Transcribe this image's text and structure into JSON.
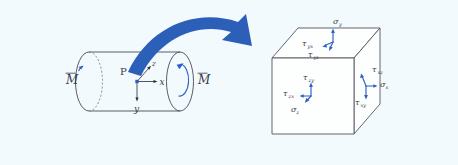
{
  "figure": {
    "background_color": "#f2fafd",
    "accent_color": "#2b5fb8",
    "outline_color": "#55555f",
    "label_color": "#3a3a48"
  },
  "cylinder": {
    "point_label": "P",
    "moment_left_label": "M",
    "moment_left_overbar": true,
    "moment_right_label": "M",
    "moment_right_overbar": true,
    "axes": [
      {
        "name": "x-axis-label",
        "label": "x"
      },
      {
        "name": "y-axis-label",
        "label": "y"
      },
      {
        "name": "z-axis-label",
        "label": "z"
      }
    ]
  },
  "transition_arrow": {
    "name": "curved-transition-arrow",
    "color": "#2b5fb8",
    "direction": "left-to-right"
  },
  "cube": {
    "faces": [
      {
        "name": "top-face",
        "normal": "y",
        "labels": [
          {
            "symbol": "σ",
            "sub": "y"
          },
          {
            "symbol": "τ",
            "sub": "yx"
          },
          {
            "symbol": "τ",
            "sub": "yz"
          }
        ]
      },
      {
        "name": "front-face",
        "normal": "z",
        "labels": [
          {
            "symbol": "τ",
            "sub": "zy"
          },
          {
            "symbol": "τ",
            "sub": "zx"
          },
          {
            "symbol": "σ",
            "sub": "z"
          }
        ]
      },
      {
        "name": "right-face",
        "normal": "x",
        "labels": [
          {
            "symbol": "τ",
            "sub": "xz"
          },
          {
            "symbol": "σ",
            "sub": "x"
          },
          {
            "symbol": "τ",
            "sub": "xy"
          }
        ]
      }
    ],
    "sigma_y": "σ",
    "sigma_y_sub": "y",
    "tau_yx": "τ",
    "tau_yx_sub": "yx",
    "tau_yz": "τ",
    "tau_yz_sub": "yz",
    "tau_zy": "τ",
    "tau_zy_sub": "zy",
    "tau_zx": "τ",
    "tau_zx_sub": "zx",
    "sigma_z": "σ",
    "sigma_z_sub": "z",
    "tau_xz": "τ",
    "tau_xz_sub": "xz",
    "sigma_x": "σ",
    "sigma_x_sub": "x",
    "tau_xy": "τ",
    "tau_xy_sub": "xy"
  }
}
